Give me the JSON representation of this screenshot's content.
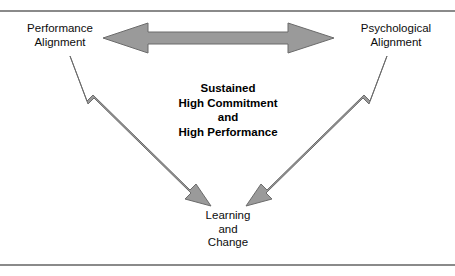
{
  "figure": {
    "type": "triangle-relationship-diagram",
    "background_color": "#ffffff",
    "rule_color": "#8a8a8a",
    "arrow_fill_color": "#9a9a9a",
    "arrow_stroke_color": "#6b6b6b",
    "text_color": "#0d0d0d"
  },
  "nodes": [
    {
      "id": "performance-alignment",
      "line1": "Performance",
      "line2": "Alignment",
      "position": "top-left"
    },
    {
      "id": "psychological-alignment",
      "line1": "Psychological",
      "line2": "Alignment",
      "position": "top-right"
    },
    {
      "id": "learning-and-change",
      "line1": "Learning",
      "line2": "and",
      "line3": "Change",
      "position": "bottom-center"
    }
  ],
  "center": {
    "line1": "Sustained",
    "line2": "High Commitment",
    "line3": "and",
    "line4": "High Performance"
  },
  "arrows": [
    {
      "id": "arrow-performance-psychological",
      "from": "performance-alignment",
      "to": "psychological-alignment",
      "style": "double-headed",
      "orientation": "horizontal"
    },
    {
      "id": "arrow-performance-learning",
      "from": "performance-alignment",
      "to": "learning-and-change",
      "style": "double-headed",
      "orientation": "diagonal-down-right"
    },
    {
      "id": "arrow-learning-psychological",
      "from": "learning-and-change",
      "to": "psychological-alignment",
      "style": "double-headed",
      "orientation": "diagonal-up-right"
    }
  ]
}
